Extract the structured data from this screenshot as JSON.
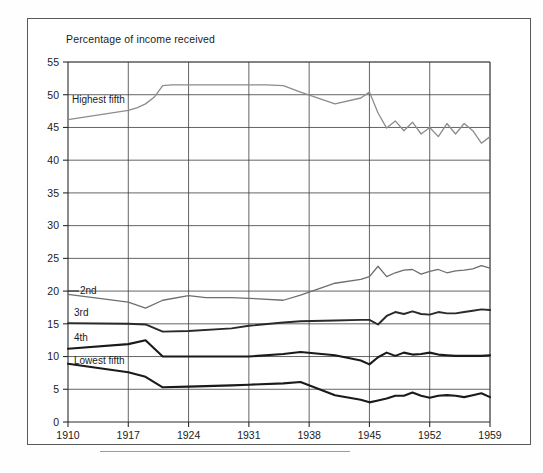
{
  "figure": {
    "title": "Percentage of income received",
    "bottom_rule": true
  },
  "axes": {
    "y_ticks": [
      "0",
      "5",
      "10",
      "15",
      "20",
      "25",
      "30",
      "35",
      "40",
      "45",
      "50",
      "55"
    ],
    "x_ticks": [
      "1910",
      "1917",
      "1924",
      "1931",
      "1938",
      "1945",
      "1952",
      "1959"
    ]
  },
  "series_labels": {
    "highest": "Highest fifth",
    "second": "2nd",
    "third": "3rd",
    "fourth": "4th",
    "lowest": "Lowest fifth"
  },
  "chart_data": {
    "type": "line",
    "title": "Percentage of income received",
    "xlabel": "",
    "ylabel": "Percentage of income received",
    "xlim": [
      1910,
      1959
    ],
    "ylim": [
      0,
      55
    ],
    "ytick_step": 5,
    "xtick_step": 7,
    "grid": true,
    "legend": "inline-labels",
    "colors": {
      "highest": "#8c8c8c",
      "second": "#6e6e6e",
      "third": "#2a2a2a",
      "fourth": "#1a1a1a",
      "lowest": "#1a1a1a"
    },
    "series": [
      {
        "name": "Highest fifth",
        "color": "#8c8c8c",
        "x": [
          1910,
          1917,
          1918,
          1919,
          1920,
          1921,
          1922,
          1929,
          1931,
          1933,
          1935,
          1936,
          1937,
          1941,
          1944,
          1945,
          1946,
          1947,
          1948,
          1949,
          1950,
          1951,
          1952,
          1953,
          1954,
          1955,
          1956,
          1957,
          1958,
          1959
        ],
        "values": [
          46.2,
          47.6,
          48.0,
          48.6,
          49.6,
          51.4,
          51.5,
          51.5,
          51.5,
          51.5,
          51.4,
          50.9,
          50.4,
          48.6,
          49.5,
          50.4,
          47.2,
          44.9,
          46.0,
          44.5,
          45.8,
          44.0,
          45.0,
          43.6,
          45.6,
          44.0,
          45.6,
          44.5,
          42.6,
          43.6
        ]
      },
      {
        "name": "2nd",
        "color": "#6e6e6e",
        "x": [
          1910,
          1917,
          1919,
          1921,
          1924,
          1926,
          1929,
          1931,
          1935,
          1937,
          1941,
          1944,
          1945,
          1946,
          1947,
          1948,
          1949,
          1950,
          1951,
          1952,
          1953,
          1954,
          1955,
          1956,
          1957,
          1958,
          1959
        ],
        "values": [
          19.5,
          18.3,
          17.4,
          18.6,
          19.3,
          19.0,
          19.0,
          18.9,
          18.6,
          19.4,
          21.2,
          21.8,
          22.2,
          23.8,
          22.2,
          22.8,
          23.2,
          23.3,
          22.6,
          23.0,
          23.3,
          22.8,
          23.1,
          23.2,
          23.4,
          23.9,
          23.5
        ]
      },
      {
        "name": "3rd",
        "color": "#2a2a2a",
        "x": [
          1910,
          1917,
          1919,
          1921,
          1924,
          1929,
          1931,
          1935,
          1937,
          1941,
          1944,
          1945,
          1946,
          1947,
          1948,
          1949,
          1950,
          1951,
          1952,
          1953,
          1954,
          1955,
          1956,
          1957,
          1958,
          1959
        ],
        "values": [
          15.1,
          15.0,
          14.9,
          13.8,
          13.9,
          14.3,
          14.7,
          15.2,
          15.4,
          15.5,
          15.6,
          15.6,
          14.9,
          16.2,
          16.8,
          16.5,
          16.9,
          16.5,
          16.4,
          16.8,
          16.6,
          16.6,
          16.8,
          17.0,
          17.2,
          17.1
        ]
      },
      {
        "name": "4th",
        "color": "#1a1a1a",
        "x": [
          1910,
          1917,
          1919,
          1921,
          1924,
          1929,
          1931,
          1935,
          1937,
          1941,
          1944,
          1945,
          1946,
          1947,
          1948,
          1949,
          1950,
          1951,
          1952,
          1953,
          1954,
          1955,
          1956,
          1957,
          1958,
          1959
        ],
        "values": [
          11.2,
          11.9,
          12.5,
          10.0,
          10.0,
          10.0,
          10.0,
          10.4,
          10.7,
          10.2,
          9.4,
          8.8,
          9.9,
          10.6,
          10.1,
          10.6,
          10.3,
          10.4,
          10.6,
          10.3,
          10.2,
          10.1,
          10.1,
          10.1,
          10.1,
          10.2
        ]
      },
      {
        "name": "Lowest fifth",
        "color": "#1a1a1a",
        "x": [
          1910,
          1917,
          1919,
          1921,
          1924,
          1929,
          1931,
          1935,
          1937,
          1941,
          1944,
          1945,
          1946,
          1947,
          1948,
          1949,
          1950,
          1951,
          1952,
          1953,
          1954,
          1955,
          1956,
          1957,
          1958,
          1959
        ],
        "values": [
          8.9,
          7.6,
          6.9,
          5.3,
          5.4,
          5.6,
          5.7,
          5.9,
          6.1,
          4.1,
          3.4,
          3.0,
          3.3,
          3.6,
          4.0,
          4.0,
          4.5,
          4.0,
          3.7,
          4.0,
          4.1,
          4.0,
          3.8,
          4.1,
          4.4,
          3.8
        ]
      }
    ]
  }
}
